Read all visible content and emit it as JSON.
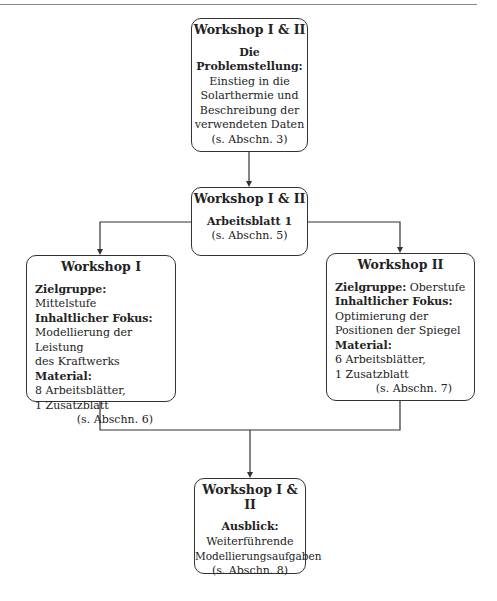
{
  "boxes": {
    "intro": {
      "title": "Workshop I & II",
      "heading_line1": "Die",
      "heading_line2": "Problemstellung:",
      "lines": [
        "Einstieg in die",
        "Solarthermie und",
        "Beschreibung der",
        "verwendeten Daten"
      ],
      "ref": "(s. Abschn. 3)"
    },
    "sheet1": {
      "title": "Workshop I & II",
      "heading": "Arbeitsblatt 1",
      "ref": "(s. Abschn. 5)"
    },
    "workshop1": {
      "title": "Workshop I",
      "target_label": "Zielgruppe:",
      "target_value": "Mittelstufe",
      "focus_label": "Inhaltlicher Fokus:",
      "focus_lines": [
        "Modellierung der Leistung",
        "des Kraftwerks"
      ],
      "material_label": "Material:",
      "material_lines": [
        "8 Arbeitsblätter,",
        "1 Zusatzblatt"
      ],
      "ref": "(s. Abschn. 6)"
    },
    "workshop2": {
      "title": "Workshop II",
      "target_label": "Zielgruppe:",
      "target_value": "Oberstufe",
      "focus_label": "Inhaltlicher Fokus:",
      "focus_lines": [
        "Optimierung der",
        "Positionen der Spiegel"
      ],
      "material_label": "Material:",
      "material_lines": [
        "6 Arbeitsblätter,",
        "1 Zusatzblatt"
      ],
      "ref": "(s. Abschn. 7)"
    },
    "outlook": {
      "title": "Workshop I & II",
      "heading": "Ausblick:",
      "lines": [
        "Weiterführende",
        "Modellierungsaufgaben"
      ],
      "ref": "(s. Abschn. 8)"
    }
  }
}
